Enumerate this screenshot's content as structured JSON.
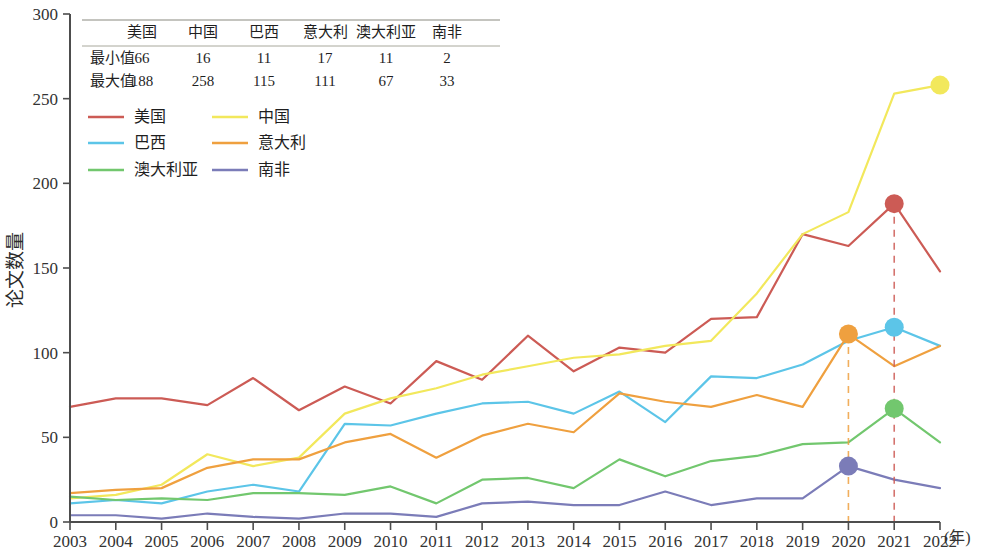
{
  "chart_data": {
    "type": "line",
    "title": "",
    "xlabel": "年",
    "ylabel": "论文数量",
    "xlim": [
      2003,
      2022
    ],
    "ylim": [
      0,
      300
    ],
    "ytick_step": 50,
    "grid": false,
    "legend_position": "top-left",
    "x": [
      2003,
      2004,
      2005,
      2006,
      2007,
      2008,
      2009,
      2010,
      2011,
      2012,
      2013,
      2014,
      2015,
      2016,
      2017,
      2018,
      2019,
      2020,
      2021,
      2022
    ],
    "categories": [
      "2003",
      "2004",
      "2005",
      "2006",
      "2007",
      "2008",
      "2009",
      "2010",
      "2011",
      "2012",
      "2013",
      "2014",
      "2015",
      "2016",
      "2017",
      "2018",
      "2019",
      "2020",
      "2021",
      "2022"
    ],
    "series": [
      {
        "name": "美国",
        "color": "#cc5b55",
        "values": [
          68,
          73,
          73,
          69,
          85,
          66,
          80,
          70,
          95,
          84,
          110,
          89,
          103,
          100,
          120,
          121,
          170,
          163,
          188,
          148
        ],
        "min": 66,
        "max": 188,
        "marker": {
          "x": 2021,
          "y": 188,
          "color": "#cc5b55",
          "guide": true
        }
      },
      {
        "name": "中国",
        "color": "#f2e85c",
        "values": [
          14,
          16,
          22,
          40,
          33,
          38,
          64,
          73,
          79,
          87,
          92,
          97,
          99,
          104,
          107,
          135,
          170,
          183,
          253,
          258
        ],
        "min": 16,
        "max": 258,
        "marker": {
          "x": 2022,
          "y": 258,
          "color": "#f2e85c",
          "guide": false
        }
      },
      {
        "name": "巴西",
        "color": "#5cc5e8",
        "values": [
          11,
          13,
          11,
          18,
          22,
          18,
          58,
          57,
          64,
          70,
          71,
          64,
          77,
          59,
          86,
          85,
          93,
          107,
          115,
          104
        ],
        "min": 11,
        "max": 115,
        "marker": {
          "x": 2021,
          "y": 115,
          "color": "#5cc5e8",
          "guide": false
        }
      },
      {
        "name": "意大利",
        "color": "#efa03f",
        "values": [
          17,
          19,
          20,
          32,
          37,
          37,
          47,
          52,
          38,
          51,
          58,
          53,
          76,
          71,
          68,
          75,
          68,
          111,
          92,
          104
        ],
        "min": 17,
        "max": 111,
        "marker": {
          "x": 2020,
          "y": 111,
          "color": "#efa03f",
          "guide": true
        }
      },
      {
        "name": "澳大利亚",
        "color": "#72c76e",
        "values": [
          15,
          13,
          14,
          13,
          17,
          17,
          16,
          21,
          11,
          25,
          26,
          20,
          37,
          27,
          36,
          39,
          46,
          47,
          67,
          47
        ],
        "min": 11,
        "max": 67,
        "marker": {
          "x": 2021,
          "y": 67,
          "color": "#72c76e",
          "guide": false
        }
      },
      {
        "name": "南非",
        "color": "#7b7cb8",
        "values": [
          4,
          4,
          2,
          5,
          3,
          2,
          5,
          5,
          3,
          11,
          12,
          10,
          10,
          18,
          10,
          14,
          14,
          33,
          25,
          20
        ],
        "min": 2,
        "max": 33,
        "marker": {
          "x": 2020,
          "y": 33,
          "color": "#7b7cb8",
          "guide": false
        }
      }
    ]
  },
  "summary_table": {
    "corner": "",
    "columns": [
      "美国",
      "中国",
      "巴西",
      "意大利",
      "澳大利亚",
      "南非"
    ],
    "rows": [
      {
        "label": "最小值",
        "values": [
          "66",
          "16",
          "11",
          "17",
          "11",
          "2"
        ]
      },
      {
        "label": "最大值",
        "values": [
          "188",
          "258",
          "115",
          "111",
          "67",
          "33"
        ]
      }
    ]
  },
  "axes": {
    "y_ticks": [
      "0",
      "50",
      "100",
      "150",
      "200",
      "250",
      "300"
    ],
    "x_ticks": [
      "2003",
      "2004",
      "2005",
      "2006",
      "2007",
      "2008",
      "2009",
      "2010",
      "2011",
      "2012",
      "2013",
      "2014",
      "2015",
      "2016",
      "2017",
      "2018",
      "2019",
      "2020",
      "2021",
      "2022"
    ],
    "y_title": "论文数量",
    "x_unit": "(年)"
  },
  "legend": {
    "entries": [
      "美国",
      "中国",
      "巴西",
      "意大利",
      "澳大利亚",
      "南非"
    ]
  }
}
